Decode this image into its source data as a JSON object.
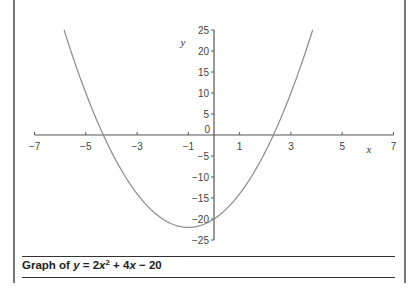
{
  "caption": {
    "prefix": "Graph of ",
    "y": "y",
    "eq": " = 2",
    "x1": "x",
    "exp": "2",
    "plus": " + 4",
    "x2": "x",
    "tail": " − 20"
  },
  "chart_data": {
    "type": "line",
    "function": "y = 2x^2 + 4x - 20",
    "xlabel": "x",
    "ylabel": "y",
    "xlim": [
      -7,
      7
    ],
    "ylim": [
      -25,
      25
    ],
    "x_ticks": [
      -7,
      -5,
      -3,
      -1,
      1,
      3,
      5,
      7
    ],
    "y_ticks": [
      25,
      20,
      15,
      10,
      5,
      0,
      -5,
      -10,
      -15,
      -20,
      -25
    ],
    "x_tick_labels": [
      "−7",
      "−5",
      "−3",
      "−1",
      "1",
      "3",
      "5",
      "7"
    ],
    "y_tick_labels": [
      "25",
      "20",
      "15",
      "10",
      "5",
      "0",
      "−5",
      "−10",
      "−15",
      "−20",
      "−25"
    ],
    "grid": false,
    "legend": null,
    "series": [
      {
        "name": "y = 2x^2 + 4x - 20",
        "x": [
          -5.85,
          -5.5,
          -5,
          -4.5,
          -4,
          -3.5,
          -3,
          -2.5,
          -2,
          -1.5,
          -1,
          -0.5,
          0,
          0.5,
          1,
          1.5,
          2,
          2.5,
          3,
          3.5,
          3.85
        ],
        "y": [
          25,
          18.5,
          10,
          2.5,
          -4,
          -9.5,
          -14,
          -17.5,
          -20,
          -21.5,
          -22,
          -21.5,
          -20,
          -17.5,
          -14,
          -9.5,
          -4,
          2.5,
          10,
          18.5,
          25
        ]
      }
    ],
    "roots": [
      -4.32,
      2.32
    ],
    "vertex": [
      -1,
      -22
    ],
    "y_intercept": -20
  },
  "geometry": {
    "origin_px": [
      214,
      135
    ],
    "px_per_x": 25.64,
    "px_per_y": 4.2
  }
}
